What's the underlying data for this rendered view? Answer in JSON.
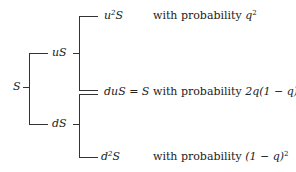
{
  "nodes": {
    "root": "S",
    "up": "uS",
    "down": "dS",
    "uu_base": "u",
    "uu_exp": "2",
    "uu_tail": "S",
    "ud": "duS = S",
    "dd_base": "d",
    "dd_exp": "2",
    "dd_tail": "S"
  },
  "probabilities": {
    "prefix": "with probability",
    "uu_base": "q",
    "uu_exp": "2",
    "ud": "2q(1 − q)",
    "dd_base": "(1 − q)",
    "dd_exp": "2"
  }
}
